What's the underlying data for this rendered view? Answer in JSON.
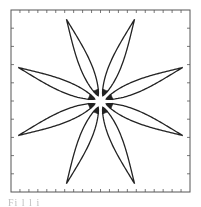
{
  "figure": {
    "petal_count": 8,
    "petal_angles_deg": [
      22.5,
      67.5,
      112.5,
      157.5,
      202.5,
      247.5,
      292.5,
      337.5
    ],
    "petal_inner_radius_fraction": 0.07,
    "petal_outer_radius_fraction": 1.0,
    "line_color": "#222222",
    "frame_color": "#555555",
    "x_ticks_count": 20,
    "y_ticks_count": 10,
    "tick_labels_visible": false
  },
  "chart_data": {
    "type": "line",
    "title": "",
    "xlabel": "",
    "ylabel": "",
    "grid": false,
    "legend": "none",
    "series": [
      {
        "name": "rosette",
        "petals": 8,
        "phase_deg": 22.5,
        "r_min": 0.07,
        "r_max": 1.0
      }
    ]
  },
  "caption": {
    "text": "Fi            l  l    i          "
  }
}
